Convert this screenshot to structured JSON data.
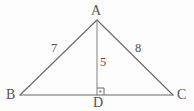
{
  "figure": {
    "kind": "geometry-diagram",
    "shape": "triangle-with-altitude",
    "background_color": "#fdfdfd",
    "stroke_color": "#6b6768",
    "text_color": "#555152",
    "vertices": [
      {
        "id": "A",
        "label": "A",
        "x": 97,
        "y": 20,
        "role": "apex"
      },
      {
        "id": "B",
        "label": "B",
        "x": 20,
        "y": 95,
        "role": "base-left"
      },
      {
        "id": "C",
        "label": "C",
        "x": 173,
        "y": 95,
        "role": "base-right"
      },
      {
        "id": "D",
        "label": "D",
        "x": 97,
        "y": 95,
        "role": "foot-of-altitude"
      }
    ],
    "segments": [
      {
        "id": "AB",
        "from": "A",
        "to": "B",
        "style": "solid"
      },
      {
        "id": "AC",
        "from": "A",
        "to": "C",
        "style": "solid"
      },
      {
        "id": "BC",
        "from": "B",
        "to": "C",
        "style": "solid"
      },
      {
        "id": "AD",
        "from": "A",
        "to": "D",
        "style": "solid"
      }
    ],
    "measures": [
      {
        "id": "AB",
        "value": "7",
        "segment": "AB"
      },
      {
        "id": "AC",
        "value": "8",
        "segment": "AC"
      },
      {
        "id": "AD",
        "value": "5",
        "segment": "AD"
      }
    ],
    "right_angle_marker": {
      "at_vertex": "D",
      "between": "AD and DC",
      "x": 97,
      "y": 88,
      "size": 7
    }
  }
}
